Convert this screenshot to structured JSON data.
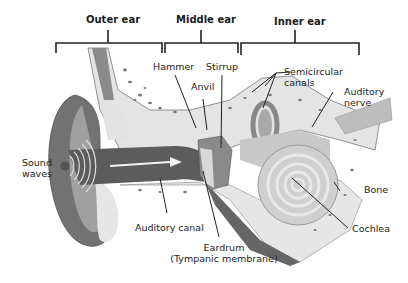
{
  "diagram": {
    "sections": [
      {
        "label": "Outer ear"
      },
      {
        "label": "Middle ear"
      },
      {
        "label": "Inner ear"
      }
    ],
    "labels": {
      "hammer": "Hammer",
      "anvil": "Anvil",
      "stirrup": "Stirrup",
      "semicircular_1": "Semicircular",
      "semicircular_2": "canals",
      "auditory_nerve_1": "Auditory",
      "auditory_nerve_2": "nerve",
      "sound_waves_1": "Sound",
      "sound_waves_2": "waves",
      "bone": "Bone",
      "cochlea": "Cochlea",
      "auditory_canal": "Auditory canal",
      "eardrum_1": "Eardrum",
      "eardrum_2": "(Tympanic membrane)"
    },
    "colors": {
      "skin_dark": "#6e6e6e",
      "skin_mid": "#9a9a9a",
      "cartilage": "#dcdcdc",
      "bone_fill": "#e4e4e4",
      "bone_spots": "#7a7a7a",
      "canal": "#5a5a5a",
      "cochlea": "#d0d0d0"
    }
  }
}
